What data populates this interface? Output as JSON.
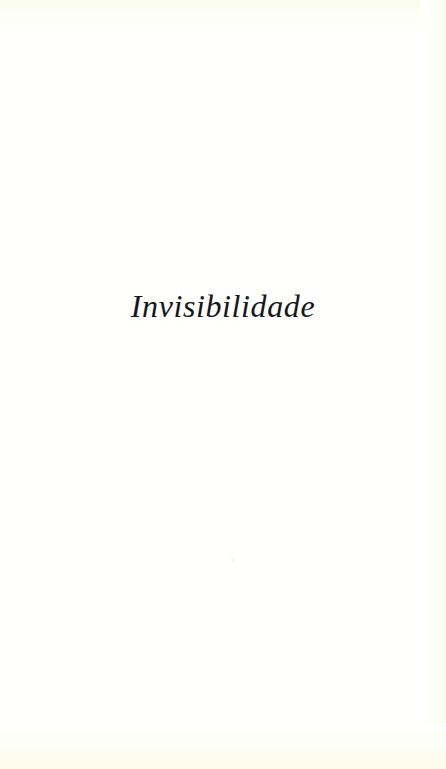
{
  "document": {
    "kind": "scanned-book-page",
    "page_type": "part-title-page",
    "language": "pt",
    "background_color": "#fffffd",
    "ink_color": "#17171a",
    "edge_tint_color": "#fcfdef"
  },
  "content": {
    "part_title": "Invisibilidade"
  },
  "artifacts": {
    "speck_label": ""
  }
}
